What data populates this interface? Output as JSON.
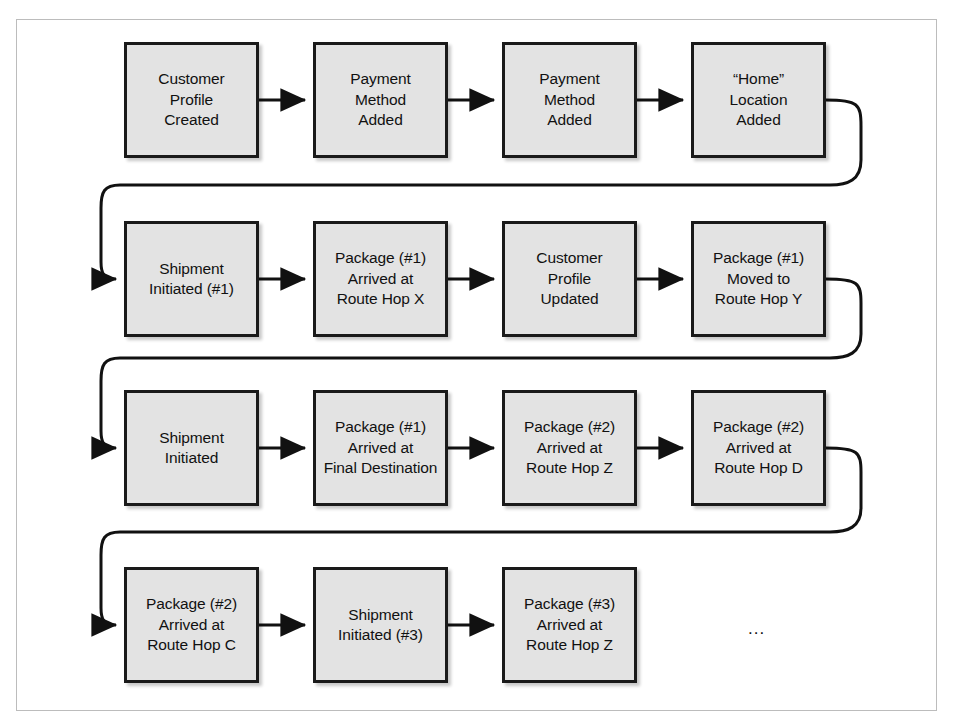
{
  "figure": {
    "kind": "event-stream-flow-diagram",
    "frame_color": "#bcbcbc",
    "box_fill": "#e3e3e3",
    "box_border": "#1a1a1a",
    "arrow_color": "#111111",
    "continuation_marker": "..."
  },
  "rows": [
    {
      "index": 1,
      "nodes": [
        {
          "id": "r1n1",
          "label": "Customer\nProfile\nCreated"
        },
        {
          "id": "r1n2",
          "label": "Payment\nMethod\nAdded"
        },
        {
          "id": "r1n3",
          "label": "Payment\nMethod\nAdded"
        },
        {
          "id": "r1n4",
          "label": "“Home”\nLocation\nAdded"
        }
      ]
    },
    {
      "index": 2,
      "nodes": [
        {
          "id": "r2n1",
          "label": "Shipment\nInitiated (#1)"
        },
        {
          "id": "r2n2",
          "label": "Package (#1)\nArrived at\nRoute Hop X"
        },
        {
          "id": "r2n3",
          "label": "Customer\nProfile\nUpdated"
        },
        {
          "id": "r2n4",
          "label": "Package (#1)\nMoved to\nRoute Hop Y"
        }
      ]
    },
    {
      "index": 3,
      "nodes": [
        {
          "id": "r3n1",
          "label": "Shipment\nInitiated"
        },
        {
          "id": "r3n2",
          "label": "Package (#1)\nArrived at\nFinal Destination"
        },
        {
          "id": "r3n3",
          "label": "Package (#2)\nArrived at\nRoute Hop Z"
        },
        {
          "id": "r3n4",
          "label": "Package (#2)\nArrived at\nRoute Hop D"
        }
      ]
    },
    {
      "index": 4,
      "nodes": [
        {
          "id": "r4n1",
          "label": "Package (#2)\nArrived at\nRoute Hop C"
        },
        {
          "id": "r4n2",
          "label": "Shipment\nInitiated (#3)"
        },
        {
          "id": "r4n3",
          "label": "Package (#3)\nArrived at\nRoute Hop Z"
        }
      ]
    }
  ]
}
